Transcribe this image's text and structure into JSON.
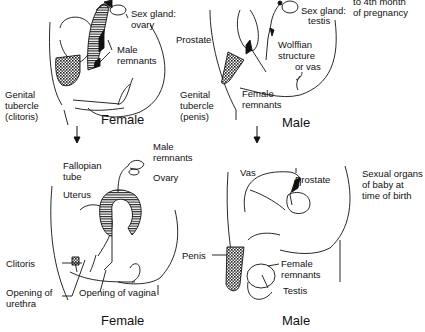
{
  "diagram": {
    "top_note": [
      "to 4th month",
      "of pregnancy"
    ],
    "bottom_note": [
      "Sexual organs",
      "of baby at",
      "time of birth"
    ],
    "panels": {
      "top_female": {
        "caption": "Female",
        "labels": {
          "sex_gland": [
            "Sex gland:",
            "ovary"
          ],
          "male_remnants": [
            "Male",
            "remnants"
          ],
          "genital_tubercle": [
            "Genital",
            "tubercle",
            "(clitoris)"
          ]
        }
      },
      "top_male": {
        "caption": "Male",
        "labels": {
          "prostate": "Prostate",
          "sex_gland": [
            "Sex gland:",
            "testis"
          ],
          "wolffian": [
            "Wolffian",
            "structure",
            "or vas"
          ],
          "genital_tubercle": [
            "Genital",
            "tubercle",
            "(penis)"
          ],
          "female_remnants": [
            "Female",
            "remnants"
          ]
        }
      },
      "bottom_female": {
        "caption": "Female",
        "labels": {
          "male_remnants": [
            "Male",
            "remnants"
          ],
          "fallopian_tube": [
            "Fallopian",
            "tube"
          ],
          "ovary": "Ovary",
          "uterus": "Uterus",
          "clitoris": "Clitoris",
          "opening_urethra": [
            "Opening of",
            "urethra"
          ],
          "opening_vagina": "Opening of vagina"
        }
      },
      "bottom_male": {
        "caption": "Male",
        "labels": {
          "vas": "Vas",
          "prostate": "Prostate",
          "penis": "Penis",
          "female_remnants": [
            "Female",
            "remnants"
          ],
          "testis": "Testis"
        }
      }
    },
    "colors": {
      "ink": "#111111",
      "background": "#ffffff"
    }
  }
}
